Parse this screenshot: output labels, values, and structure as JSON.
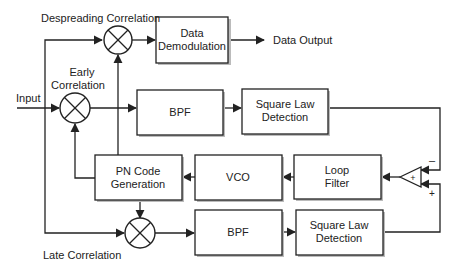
{
  "diagram": {
    "type": "block-diagram",
    "labels": {
      "despreading": "Despreading Correlation",
      "early_1": "Early",
      "early_2": "Correlation",
      "input": "Input",
      "late": "Late Correlation",
      "data_output": "Data Output",
      "minus": "–",
      "plus": "+",
      "sum_plus": "+"
    },
    "blocks": {
      "data_demod": {
        "line1": "Data",
        "line2": "Demodulation"
      },
      "bpf_top": {
        "line1": "BPF"
      },
      "sqlaw_top": {
        "line1": "Square Law",
        "line2": "Detection"
      },
      "pn_code": {
        "line1": "PN Code",
        "line2": "Generation"
      },
      "vco": {
        "line1": "VCO"
      },
      "loop_filter": {
        "line1": "Loop",
        "line2": "Filter"
      },
      "bpf_bottom": {
        "line1": "BPF"
      },
      "sqlaw_bottom": {
        "line1": "Square Law",
        "line2": "Detection"
      }
    },
    "colors": {
      "line": "#222222",
      "background": "#ffffff",
      "shadow": "#bbbbbb"
    }
  }
}
